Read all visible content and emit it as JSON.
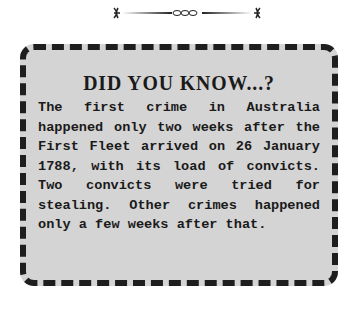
{
  "ornament": "decorative-divider",
  "box": {
    "title": "DID YOU KNOW...?",
    "text": "The first crime in Australia happened only two weeks after the First Fleet arrived on 26 January 1788, with its load of convicts. Two convicts were tried for stealing. Other crimes happened only a few weeks after that."
  },
  "colors": {
    "box_fill": "#d4d4d4",
    "border": "#1e1e1e",
    "text": "#1a1a1a"
  }
}
